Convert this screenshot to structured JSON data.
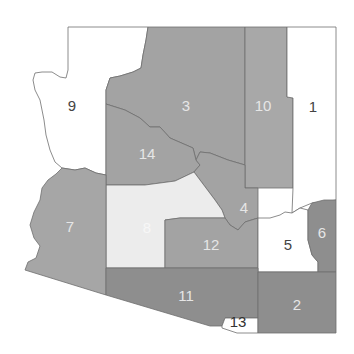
{
  "map": {
    "subject": "Arizona regions",
    "colors": {
      "white": "#ffffff",
      "light": "#ececec",
      "medium": "#a6a6a6",
      "dark": "#8c8c8c",
      "border": "#6f6f6f",
      "label_dark": "#444444",
      "label_light": "#e6e6e6"
    },
    "regions": [
      {
        "id": "1",
        "label": "1",
        "fill": "#ffffff",
        "label_color": "#444444",
        "lx": 313,
        "ly": 108
      },
      {
        "id": "2",
        "label": "2",
        "fill": "#8e8e8e",
        "label_color": "#e6e6e6",
        "lx": 297,
        "ly": 306
      },
      {
        "id": "3",
        "label": "3",
        "fill": "#a3a3a3",
        "label_color": "#e6e6e6",
        "lx": 186,
        "ly": 107
      },
      {
        "id": "4",
        "label": "4",
        "fill": "#a3a3a3",
        "label_color": "#e6e6e6",
        "lx": 244,
        "ly": 209
      },
      {
        "id": "5",
        "label": "5",
        "fill": "#ffffff",
        "label_color": "#444444",
        "lx": 288,
        "ly": 246
      },
      {
        "id": "6",
        "label": "6",
        "fill": "#8e8e8e",
        "label_color": "#e6e6e6",
        "lx": 322,
        "ly": 234
      },
      {
        "id": "7",
        "label": "7",
        "fill": "#a6a6a6",
        "label_color": "#e6e6e6",
        "lx": 70,
        "ly": 228
      },
      {
        "id": "8",
        "label": "8",
        "fill": "#ececec",
        "label_color": "#f7f7f7",
        "lx": 147,
        "ly": 229
      },
      {
        "id": "9",
        "label": "9",
        "fill": "#ffffff",
        "label_color": "#444444",
        "lx": 72,
        "ly": 107
      },
      {
        "id": "10",
        "label": "10",
        "fill": "#a8a8a8",
        "label_color": "#e6e6e6",
        "lx": 263,
        "ly": 107
      },
      {
        "id": "11",
        "label": "11",
        "fill": "#8e8e8e",
        "label_color": "#e6e6e6",
        "lx": 186,
        "ly": 297
      },
      {
        "id": "12",
        "label": "12",
        "fill": "#a3a3a3",
        "label_color": "#e6e6e6",
        "lx": 211,
        "ly": 246
      },
      {
        "id": "13",
        "label": "13",
        "fill": "#ffffff",
        "label_color": "#333333",
        "lx": 238,
        "ly": 323
      },
      {
        "id": "14",
        "label": "14",
        "fill": "#a3a3a3",
        "label_color": "#e6e6e6",
        "lx": 147,
        "ly": 155
      }
    ]
  }
}
